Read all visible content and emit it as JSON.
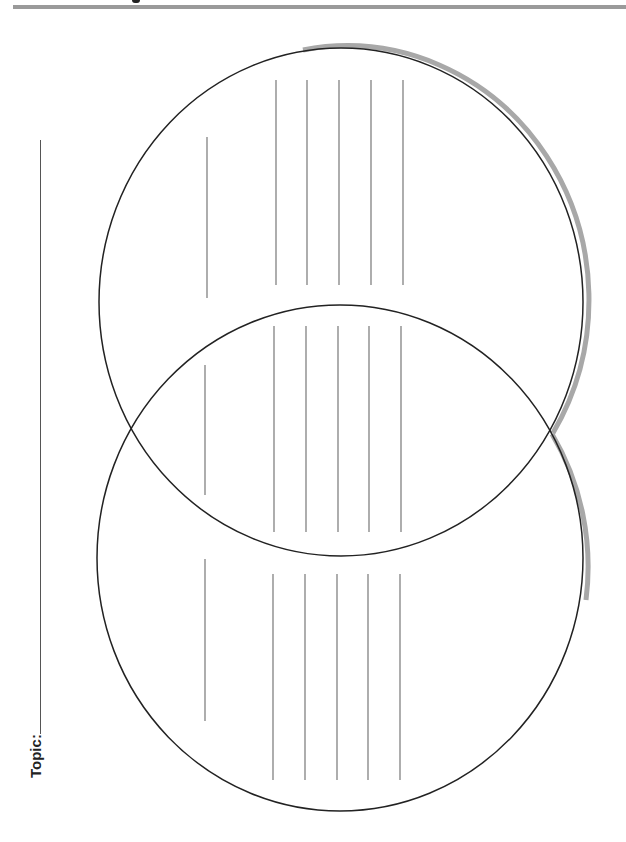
{
  "worksheet": {
    "type": "Venn diagram",
    "topic_label": "Topic:",
    "topic_value": "",
    "regions": [
      {
        "name": "top-circle-only",
        "writing_lines": 6
      },
      {
        "name": "overlap",
        "writing_lines": 6
      },
      {
        "name": "bottom-circle-only",
        "writing_lines": 6
      }
    ]
  },
  "colors": {
    "outline": "#222222",
    "shadow": "#a8a8a8",
    "writing_line": "#777777",
    "header_bar": "#9a9a9a"
  }
}
